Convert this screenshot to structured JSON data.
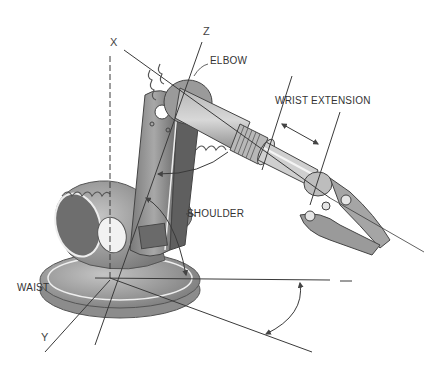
{
  "figure": {
    "axes": {
      "x": "X",
      "y": "Y",
      "z": "Z"
    },
    "joints": {
      "elbow": "ELBOW",
      "wrist_extension": "WRIST EXTENSION",
      "shoulder": "SHOULDER",
      "waist": "WAIST"
    }
  },
  "colors": {
    "background": "#ffffff",
    "line": "#3a3a3a",
    "metal_dark": "#6b6b6b",
    "metal_mid": "#9a9a9a",
    "metal_light": "#c8c8c8",
    "highlight": "#eeeeee",
    "label_text": "#333333"
  }
}
